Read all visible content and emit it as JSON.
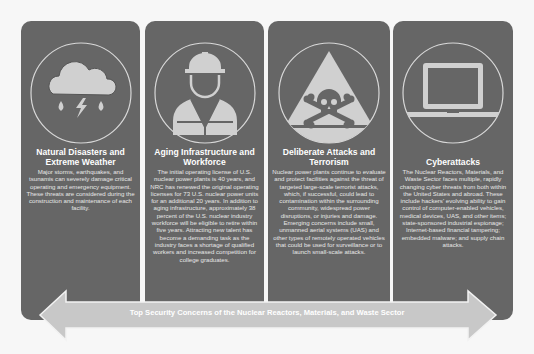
{
  "colors": {
    "card_background": "#666666",
    "icon_fill": "#d0d0d0",
    "banner_fill": "#c8c8c8",
    "page_background": "#f7f7f7"
  },
  "cards": [
    {
      "icon": "storm-cloud-icon",
      "title": "Natural Disasters and Extreme Weather",
      "body": "Major storms, earthquakes, and tsunamis can severely damage critical operating and emergency equipment. These threats are considered during the construction and maintenance of each facility."
    },
    {
      "icon": "construction-worker-icon",
      "title": "Aging Infrastructure and Workforce",
      "body": "The initial operating license of U.S. nuclear power plants is 40 years, and NRC has renewed the original operating licenses for 73 U.S. nuclear power units for an additional 20 years. In addition to aging infrastructure, approximately 38 percent of the U.S. nuclear industry workforce will be eligible to retire within five years. Attracting new talent has become a demanding task as the industry faces a shortage of qualified workers and increased competition for college graduates."
    },
    {
      "icon": "skull-crossbones-warning-icon",
      "title": "Deliberate Attacks and Terrorism",
      "body": "Nuclear power plants continue to evaluate and protect facilities against the threat of targeted large-scale terrorist attacks, which, if successful, could lead to contamination within the surrounding community, widespread power disruptions, or injuries and damage. Emerging concerns include small, unmanned aerial systems (UAS) and other types of remotely operated vehicles that could be used for surveillance or to launch small-scale attacks."
    },
    {
      "icon": "laptop-icon",
      "title": "Cyberattacks",
      "body": "The Nuclear Reactors, Materials, and Waste Sector faces multiple, rapidly changing cyber threats from both within the United States and abroad. These include hackers' evolving ability to gain control of computer-enabled vehicles, medical devices, UAS, and other items; state-sponsored industrial espionage; Internet-based financial tampering; embedded malware; and supply chain attacks."
    }
  ],
  "banner": {
    "label": "Top Security Concerns of the Nuclear Reactors, Materials, and Waste Sector"
  }
}
